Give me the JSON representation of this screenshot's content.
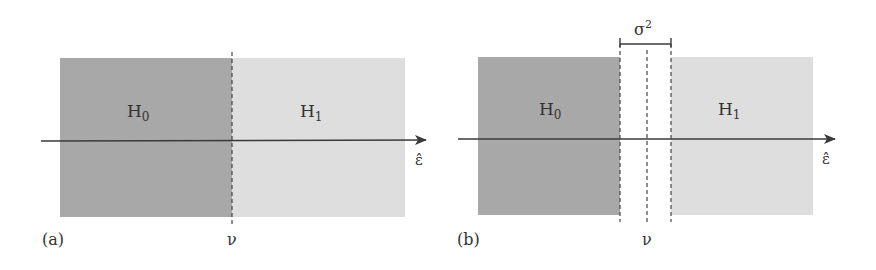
{
  "figure": {
    "colors": {
      "h0_region": "#a8a8a8",
      "h1_region": "#dedede",
      "gap_region": "#ffffff",
      "axis": "#3a3a3a",
      "dashed": "#444444"
    },
    "panel_a": {
      "tag": "(a)",
      "region_left_label": "H",
      "region_left_sub": "0",
      "region_right_label": "H",
      "region_right_sub": "1",
      "axis_label": "ε̂",
      "threshold_label": "ν"
    },
    "panel_b": {
      "tag": "(b)",
      "region_left_label": "H",
      "region_left_sub": "0",
      "region_right_label": "H",
      "region_right_sub": "1",
      "axis_label": "ε̂",
      "threshold_label": "ν",
      "band_label": "σ",
      "band_sup": "2"
    }
  }
}
